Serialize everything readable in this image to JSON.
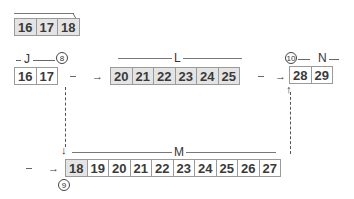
{
  "groups": {
    "top": {
      "cells": [
        "16",
        "17",
        "18"
      ]
    },
    "J": {
      "label": "J",
      "marker": "8",
      "cells": [
        "16",
        "17"
      ]
    },
    "L": {
      "label": "L",
      "cells": [
        "20",
        "21",
        "22",
        "23",
        "24",
        "25"
      ]
    },
    "N": {
      "label": "N",
      "marker": "10",
      "cells": [
        "28",
        "29"
      ]
    },
    "M": {
      "label": "M",
      "marker": "9",
      "cells": [
        "18",
        "19",
        "20",
        "21",
        "22",
        "23",
        "24",
        "25",
        "26",
        "27"
      ]
    }
  },
  "arrows": {
    "right": "→",
    "down": "↓",
    "up": "↑",
    "dash": "—"
  },
  "colors": {
    "cell_fill": "#e4e4e4",
    "cell_border": "#9a9a9a"
  }
}
